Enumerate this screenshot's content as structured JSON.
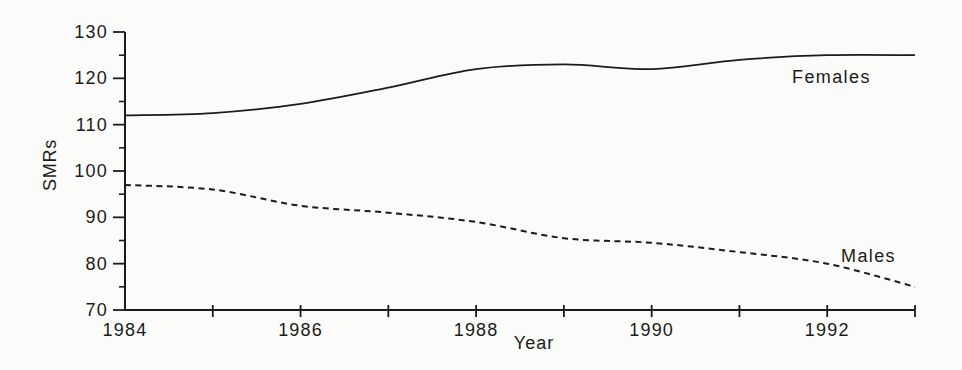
{
  "figure": {
    "background": "#fbfbf9",
    "ink": "#1b1b1b"
  },
  "chart_data": {
    "type": "line",
    "title": "",
    "xlabel": "Year",
    "ylabel": "SMRs",
    "xlim": [
      1984,
      1993
    ],
    "ylim": [
      70,
      130
    ],
    "grid": false,
    "legend_position": "inline-labels",
    "yticks": [
      70,
      80,
      90,
      100,
      110,
      120,
      130
    ],
    "ytick_minor": [
      75,
      85,
      95,
      105,
      115,
      125
    ],
    "xticks_labeled": [
      1984,
      1986,
      1988,
      1990,
      1992
    ],
    "xtick_marks": [
      1985,
      1986,
      1987,
      1988,
      1989,
      1990,
      1991,
      1992,
      1993
    ],
    "x": [
      1984,
      1985,
      1986,
      1987,
      1988,
      1989,
      1990,
      1991,
      1992,
      1993
    ],
    "series": [
      {
        "name": "Females",
        "line_style": "solid",
        "values": [
          112,
          112.5,
          114.5,
          118,
          122,
          123,
          122,
          124,
          125,
          125
        ]
      },
      {
        "name": "Males",
        "line_style": "dashed",
        "values": [
          97,
          96,
          92.5,
          91,
          89,
          85.5,
          84.5,
          82.5,
          80,
          75
        ]
      }
    ]
  }
}
